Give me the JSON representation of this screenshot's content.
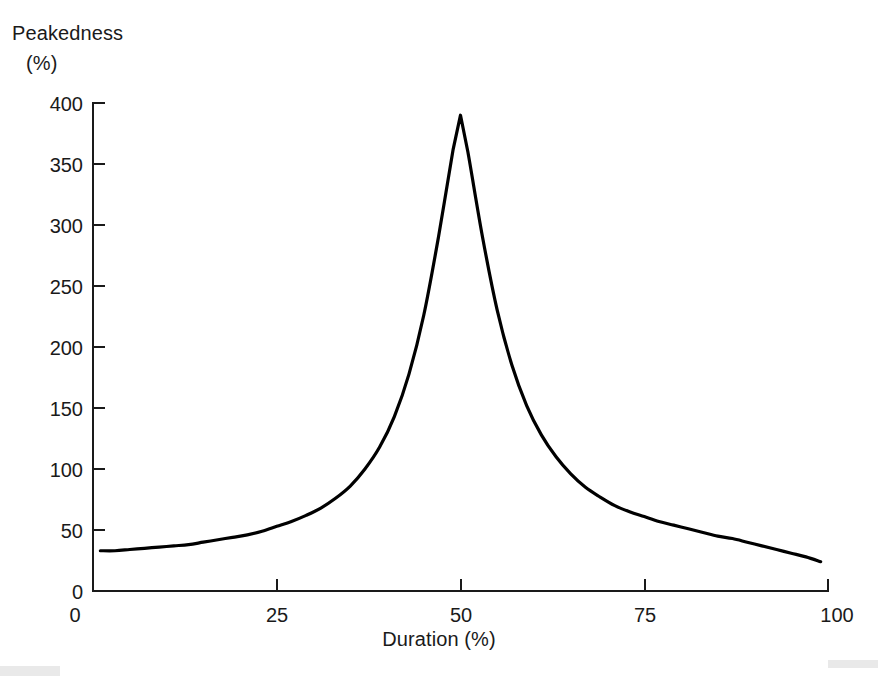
{
  "figure": {
    "background_color": "#ffffff",
    "line_color": "#000000",
    "text_color": "#1a1a1a"
  },
  "labels": {
    "ylabel_line1": "Peakedness",
    "ylabel_line2": "(%)",
    "xlabel": "Duration (%)"
  },
  "chart_data": {
    "type": "line",
    "title": "",
    "xlabel": "Duration (%)",
    "ylabel": "Peakedness (%)",
    "xlim": [
      0,
      100
    ],
    "ylim": [
      0,
      400
    ],
    "xticks": [
      0,
      25,
      50,
      75,
      100
    ],
    "xtick_labels": [
      "0",
      "25",
      "50",
      "75",
      "100"
    ],
    "yticks": [
      0,
      50,
      100,
      150,
      200,
      250,
      300,
      350,
      400
    ],
    "ytick_labels": [
      "0",
      "50",
      "100",
      "150",
      "200",
      "250",
      "300",
      "350",
      "400"
    ],
    "grid": false,
    "legend": null,
    "series": [
      {
        "name": "Peakedness",
        "color": "#000000",
        "x": [
          1,
          3,
          5,
          7,
          9,
          11,
          13,
          15,
          17,
          19,
          21,
          23,
          25,
          27,
          29,
          31,
          33,
          35,
          37,
          39,
          41,
          43,
          45,
          47,
          49,
          50,
          51,
          53,
          55,
          57,
          59,
          61,
          63,
          65,
          67,
          69,
          71,
          73,
          75,
          77,
          79,
          81,
          83,
          85,
          87,
          89,
          91,
          93,
          95,
          97,
          99
        ],
        "values": [
          33,
          33,
          34,
          35,
          36,
          37,
          38,
          40,
          42,
          44,
          46,
          49,
          53,
          57,
          62,
          68,
          76,
          86,
          100,
          118,
          143,
          178,
          226,
          290,
          362,
          390,
          360,
          290,
          230,
          185,
          152,
          128,
          110,
          96,
          85,
          77,
          70,
          65,
          61,
          57,
          54,
          51,
          48,
          45,
          43,
          40,
          37,
          34,
          31,
          28,
          24
        ]
      }
    ],
    "peak": {
      "x": 50,
      "y": 390
    }
  }
}
